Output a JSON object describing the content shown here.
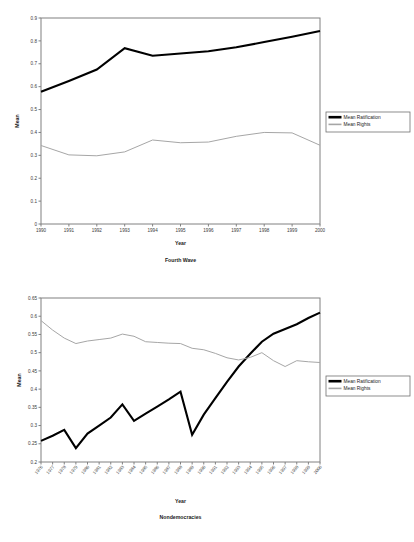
{
  "figures": [
    {
      "name": "fourth-wave",
      "chart_title": "Fourth Wave",
      "xlabel": "Year",
      "ylabel": "Mean",
      "legend": {
        "position": "right",
        "entries": [
          "Mean Ratification",
          "Mean Rights"
        ]
      }
    },
    {
      "name": "nondemocracies",
      "chart_title": "Nondemocracies",
      "xlabel": "Year",
      "ylabel": "Mean",
      "legend": {
        "position": "right",
        "entries": [
          "Mean Ratification",
          "Mean Rights"
        ]
      }
    }
  ],
  "colors": {
    "ratification": "#000000",
    "rights": "#a6a6a6",
    "axis": "#808080",
    "text": "#1a1a1a"
  },
  "chart_data": [
    {
      "type": "line",
      "title": "Fourth Wave",
      "xlabel": "Year",
      "ylabel": "Mean",
      "grid": false,
      "legend_position": "right",
      "categories": [
        "1990",
        "1991",
        "1992",
        "1993",
        "1994",
        "1995",
        "1996",
        "1997",
        "1998",
        "1999",
        "2000"
      ],
      "ylim": [
        0,
        0.9
      ],
      "yticks": [
        0,
        0.1,
        0.2,
        0.3,
        0.4,
        0.5,
        0.6,
        0.7,
        0.8,
        0.9
      ],
      "yticklabels": [
        "0",
        "0.1",
        "0.2",
        "0.3",
        "0.4",
        "0.5",
        "0.6",
        "0.7",
        "0.8",
        "0.9"
      ],
      "series": [
        {
          "name": "Mean Ratification",
          "color": "#000000",
          "values": [
            0.578,
            0.625,
            0.675,
            0.768,
            0.735,
            0.745,
            0.755,
            0.772,
            0.795,
            0.818,
            0.843
          ]
        },
        {
          "name": "Mean Rights",
          "color": "#a6a6a6",
          "values": [
            0.343,
            0.302,
            0.298,
            0.315,
            0.367,
            0.355,
            0.358,
            0.383,
            0.4,
            0.398,
            0.344
          ]
        }
      ]
    },
    {
      "type": "line",
      "title": "Nondemocracies",
      "xlabel": "Year",
      "ylabel": "Mean",
      "grid": false,
      "legend_position": "right",
      "categories": [
        "1976",
        "1977",
        "1978",
        "1979",
        "1980",
        "1981",
        "1982",
        "1983",
        "1984",
        "1985",
        "1986",
        "1987",
        "1988",
        "1989",
        "1990",
        "1991",
        "1992",
        "1993",
        "1994",
        "1995",
        "1996",
        "1997",
        "1998",
        "1999",
        "2000"
      ],
      "ylim": [
        0.2,
        0.65
      ],
      "yticks": [
        0.2,
        0.25,
        0.3,
        0.35,
        0.4,
        0.45,
        0.5,
        0.55,
        0.6,
        0.65
      ],
      "yticklabels": [
        "0.2",
        "0.25",
        "0.3",
        "0.35",
        "0.4",
        "0.45",
        "0.5",
        "0.55",
        "0.6",
        "0.65"
      ],
      "series": [
        {
          "name": "Mean Ratification",
          "color": "#000000",
          "values": [
            0.258,
            0.272,
            0.288,
            0.238,
            0.278,
            0.3,
            0.322,
            0.358,
            0.313,
            0.333,
            0.352,
            0.372,
            0.393,
            0.275,
            0.33,
            0.375,
            0.42,
            0.462,
            0.497,
            0.53,
            0.552,
            0.565,
            0.578,
            0.595,
            0.61
          ]
        },
        {
          "name": "Mean Rights",
          "color": "#a6a6a6",
          "values": [
            0.588,
            0.562,
            0.54,
            0.525,
            0.532,
            0.536,
            0.54,
            0.551,
            0.545,
            0.53,
            0.528,
            0.526,
            0.525,
            0.512,
            0.508,
            0.498,
            0.486,
            0.48,
            0.487,
            0.5,
            0.478,
            0.462,
            0.478,
            0.475,
            0.473
          ]
        }
      ]
    }
  ]
}
